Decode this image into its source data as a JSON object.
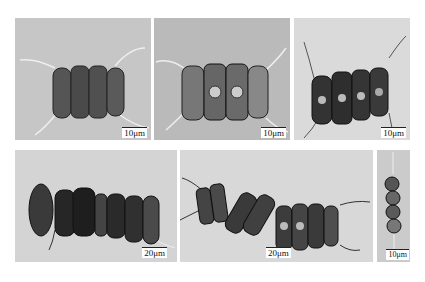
{
  "figure": {
    "panels": [
      {
        "id": "a",
        "scale_bar": "10μm",
        "subject": "four-cell chain with long setae",
        "background": "#c8c8c8"
      },
      {
        "id": "b",
        "scale_bar": "10μm",
        "subject": "four-cell chain with setae, large nuclei visible",
        "background": "#bdbdbd"
      },
      {
        "id": "c",
        "scale_bar": "10μm",
        "subject": "four-cell chain, dark chloroplasts",
        "background": "#dcdcdc"
      },
      {
        "id": "d",
        "scale_bar": "20μm",
        "subject": "long multi-cell chain",
        "background": "#d6d6d6"
      },
      {
        "id": "e",
        "scale_bar": "20μm",
        "subject": "twisted multi-cell chain with setae",
        "background": "#d9d9d9"
      },
      {
        "id": "f",
        "scale_bar": "10μm",
        "subject": "chain of four spherical cells",
        "background": "#cdcdcd"
      }
    ]
  }
}
